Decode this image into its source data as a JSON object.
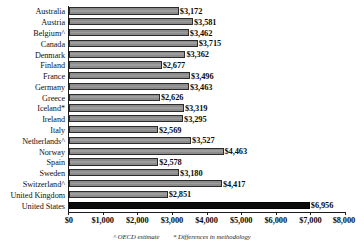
{
  "chart_data": {
    "type": "bar",
    "orientation": "horizontal",
    "title": "",
    "subtitle": "",
    "xlabel": "",
    "ylabel": "",
    "xlim": [
      0,
      8000
    ],
    "grid": false,
    "legend": null,
    "xticks": [
      {
        "value": 0,
        "label": "$0"
      },
      {
        "value": 1000,
        "label": "$1,000"
      },
      {
        "value": 2000,
        "label": "$2,000"
      },
      {
        "value": 3000,
        "label": "$3,000"
      },
      {
        "value": 4000,
        "label": "$4,000"
      },
      {
        "value": 5000,
        "label": "$5,000"
      },
      {
        "value": 6000,
        "label": "$6,000"
      },
      {
        "value": 7000,
        "label": "$7,000"
      },
      {
        "value": 8000,
        "label": "$8,000"
      }
    ],
    "categories": [
      "Australia",
      "Austria",
      "Belgium^",
      "Canada",
      "Denmark",
      "Finland",
      "France",
      "Germany",
      "Greece",
      "Iceland*",
      "Ireland",
      "Italy",
      "Netherlands^",
      "Norway",
      "Spain",
      "Sweden",
      "Switzerland^",
      "United Kingdom",
      "United States"
    ],
    "values": [
      3172,
      3581,
      3462,
      3715,
      3362,
      2677,
      3496,
      3463,
      2626,
      3319,
      3295,
      2569,
      3527,
      4463,
      2578,
      3180,
      4417,
      2851,
      6956
    ],
    "value_labels": [
      "$3,172",
      "$3,581",
      "$3,462",
      "$3,715",
      "$3,362",
      "$2,677",
      "$3,496",
      "$3,463",
      "$2,626",
      "$3,319",
      "$3,295",
      "$2,569",
      "$3,527",
      "$4,463",
      "$2,578",
      "$3,180",
      "$4,417",
      "$2,851",
      "$6,956"
    ],
    "highlight_index": 18,
    "bar_color": "#8c8c8c",
    "bar_border_color": "#2b2b2b",
    "highlight_color": "#0a0a0a",
    "annotations": [
      "^ OECD estimate",
      "* Differences in methodology"
    ]
  }
}
